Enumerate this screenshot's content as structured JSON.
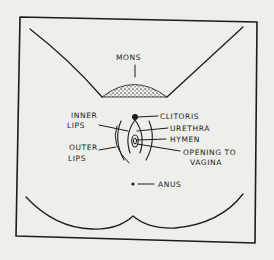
{
  "diagram": {
    "type": "anatomical-line-drawing",
    "colors": {
      "ink": "#1c1c1c",
      "paper": "#eeeeea"
    },
    "labels": {
      "mons": "MONS",
      "clitoris": "CLITORIS",
      "urethra": "URETHRA",
      "hymen": "HYMEN",
      "opening_line1": "OPENING TO",
      "opening_line2": "VAGINA",
      "inner_line1": "INNER",
      "inner_line2": "LIPS",
      "outer_line1": "OUTER",
      "outer_line2": "LIPS",
      "anus": "ANUS"
    }
  }
}
